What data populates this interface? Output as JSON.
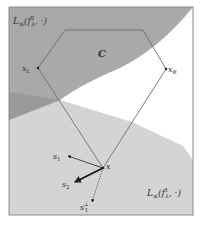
{
  "diagram": {
    "type": "geometric-illustration",
    "regions": {
      "upper_sublevel": {
        "label": "L≤(f²λ,·)",
        "label_main": "L",
        "label_sub": "≤",
        "label_func": "(f",
        "label_sup": "2",
        "label_idx": "λ",
        "label_tail": ", ·)",
        "fill": "#a9a9a9"
      },
      "lower_sublevel": {
        "label": "L≤(f¹λ,·)",
        "label_main": "L",
        "label_sub": "≤",
        "label_func": "(f",
        "label_sup": "1",
        "label_idx": "λ",
        "label_tail": ", ·)",
        "fill": "#d4d4d4"
      },
      "overlap_fill": "#9a9a9a",
      "set_C": {
        "label": "C"
      }
    },
    "points": {
      "x_L": {
        "label": "x",
        "sub": "L"
      },
      "x_R": {
        "label": "x",
        "sub": "R"
      },
      "x": {
        "label": "x"
      }
    },
    "vectors": {
      "s1": {
        "label": "s",
        "sub": "1"
      },
      "s2": {
        "label": "s",
        "sub": "2"
      },
      "s1_perp": {
        "label": "s",
        "sub": "1",
        "sup": "⊥"
      }
    },
    "colors": {
      "frame": "#8a8a8a",
      "edge": "#6e6e6e",
      "arrow": "#222222"
    }
  }
}
